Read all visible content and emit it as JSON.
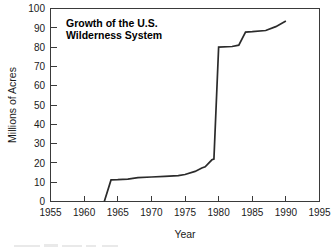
{
  "chart_data": {
    "type": "line",
    "title": "Growth of the U.S. Wilderness System",
    "title_line1": "Growth of the U.S.",
    "title_line2": "Wilderness System",
    "xlabel": "Year",
    "ylabel": "Millions of Acres",
    "xlim": [
      1955,
      1995
    ],
    "ylim": [
      0,
      100
    ],
    "xticks": [
      1955,
      1960,
      1965,
      1970,
      1975,
      1980,
      1985,
      1990,
      1995
    ],
    "yticks": [
      0,
      10,
      20,
      30,
      40,
      50,
      60,
      70,
      80,
      90,
      100
    ],
    "xtick_labels": [
      "1955",
      "1960",
      "1965",
      "1970",
      "1975",
      "1980",
      "1985",
      "1990",
      "1995"
    ],
    "ytick_labels": [
      "0",
      "10",
      "20",
      "30",
      "40",
      "50",
      "60",
      "70",
      "80",
      "90",
      "100"
    ],
    "grid": false,
    "legend": false,
    "legend_position": "none",
    "line_color": "#2b2b2b",
    "series": [
      {
        "name": "Wilderness System acreage",
        "x": [
          1963.0,
          1964.0,
          1965.0,
          1966.5,
          1968.0,
          1970.0,
          1972.0,
          1974.0,
          1975.0,
          1976.5,
          1977.5,
          1978.0,
          1979.0,
          1979.3,
          1980.0,
          1982.0,
          1983.0,
          1984.0,
          1985.0,
          1987.0,
          1988.5,
          1990.0
        ],
        "values": [
          0.0,
          11.2,
          11.3,
          11.6,
          12.4,
          12.7,
          13.0,
          13.4,
          14.0,
          15.6,
          17.4,
          18.0,
          21.6,
          22.0,
          80.0,
          80.3,
          81.0,
          87.8,
          88.0,
          88.6,
          90.6,
          93.5
        ]
      }
    ],
    "annotations": []
  },
  "figure": {
    "background_color": "#ffffff",
    "plot_background_color": "#ffffff",
    "frame_color": "#3a3a3a"
  }
}
